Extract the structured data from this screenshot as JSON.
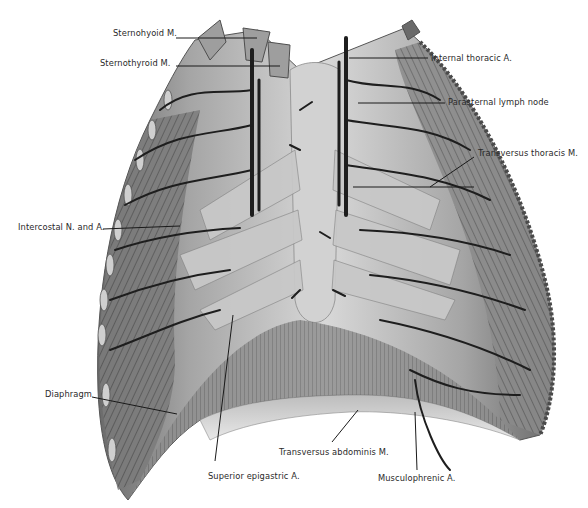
{
  "figure": {
    "colors": {
      "background": "#ffffff",
      "muscle_light": "#d9d9d9",
      "muscle_mid": "#9a9a9a",
      "muscle_dark": "#5a5a5a",
      "vessel": "#1e1e1e",
      "leader_line": "#1a1a1a",
      "label_text": "#2a2a2a"
    }
  },
  "labels": [
    {
      "id": "sternohyoid",
      "text": "Sternohyoid M.",
      "x": 113,
      "y": 28,
      "side": "left",
      "line": {
        "x1": 176,
        "y1": 38,
        "x2": 257,
        "y2": 38
      }
    },
    {
      "id": "sternothyroid",
      "text": "Sternothyroid M.",
      "x": 100,
      "y": 58,
      "side": "left",
      "line": {
        "x1": 176,
        "y1": 66,
        "x2": 280,
        "y2": 66
      }
    },
    {
      "id": "internal-thoracic",
      "text": "Internal thoracic A.",
      "x": 431,
      "y": 53,
      "side": "right",
      "line": {
        "x1": 349,
        "y1": 58,
        "x2": 428,
        "y2": 58
      }
    },
    {
      "id": "parasternal-lymph",
      "text": "Parasternal lymph node",
      "x": 448,
      "y": 97,
      "side": "right",
      "line": {
        "x1": 358,
        "y1": 103,
        "x2": 445,
        "y2": 103
      }
    },
    {
      "id": "transversus-thoracis",
      "text": "Transversus thoracis M.",
      "x": 478,
      "y": 148,
      "side": "right",
      "line": {
        "x1": 353,
        "y1": 187,
        "x2": 474,
        "y2": 187,
        "x3": 470,
        "y3": 157
      }
    },
    {
      "id": "intercostal",
      "text": "Intercostal N. and A.",
      "x": 18,
      "y": 222,
      "side": "left",
      "line": {
        "x1": 103,
        "y1": 229,
        "x2": 180,
        "y2": 226
      }
    },
    {
      "id": "diaphragm",
      "text": "Diaphragm",
      "x": 45,
      "y": 389,
      "side": "left",
      "line": {
        "x1": 92,
        "y1": 397,
        "x2": 177,
        "y2": 414
      }
    },
    {
      "id": "superior-epigastric",
      "text": "Superior epigastric A.",
      "x": 208,
      "y": 471,
      "side": "bottom",
      "line": {
        "x1": 215,
        "y1": 461,
        "x2": 233,
        "y2": 315
      }
    },
    {
      "id": "transversus-abdominis",
      "text": "Transversus abdominis M.",
      "x": 279,
      "y": 447,
      "side": "bottom",
      "line": {
        "x1": 332,
        "y1": 442,
        "x2": 358,
        "y2": 410
      }
    },
    {
      "id": "musculophrenic",
      "text": "Musculophrenic A.",
      "x": 378,
      "y": 473,
      "side": "bottom",
      "line": {
        "x1": 417,
        "y1": 470,
        "x2": 415,
        "y2": 412
      }
    }
  ]
}
